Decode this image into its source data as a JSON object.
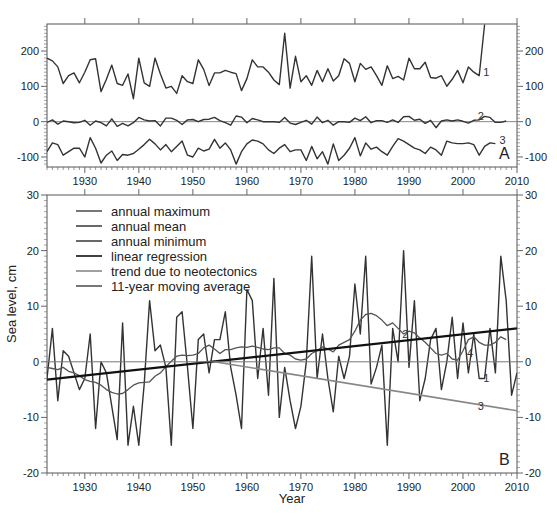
{
  "chart_data": [
    {
      "panel": "A",
      "type": "line",
      "title": "",
      "xlabel": "",
      "ylabel": "",
      "xlim": [
        1923,
        2010
      ],
      "ylim": [
        -120,
        275
      ],
      "x_ticks": [
        1930,
        1940,
        1950,
        1960,
        1970,
        1980,
        1990,
        2000,
        2010
      ],
      "y_ticks": [
        -100,
        0,
        100,
        200
      ],
      "panel_label": "A",
      "series": [
        {
          "name": "1",
          "label": "annual maximum",
          "start_year": 1923,
          "values": [
            180,
            172,
            155,
            108,
            130,
            138,
            110,
            140,
            175,
            178,
            85,
            120,
            160,
            108,
            103,
            135,
            65,
            180,
            110,
            100,
            180,
            135,
            95,
            100,
            80,
            130,
            113,
            108,
            175,
            148,
            102,
            138,
            138,
            145,
            140,
            136,
            88,
            122,
            175,
            155,
            155,
            140,
            118,
            105,
            250,
            95,
            185,
            113,
            130,
            103,
            145,
            113,
            150,
            115,
            130,
            178,
            165,
            113,
            165,
            148,
            155,
            130,
            103,
            158,
            122,
            128,
            118,
            180,
            150,
            150,
            168,
            125,
            123,
            130,
            100,
            120,
            145,
            110,
            155,
            140,
            130,
            275
          ],
          "color": "#333333"
        },
        {
          "name": "2",
          "label": "annual mean",
          "start_year": 1923,
          "values": [
            -2,
            5,
            -7,
            2,
            0,
            -3,
            -2,
            4,
            -10,
            2,
            -3,
            -12,
            8,
            -13,
            -5,
            -12,
            -3,
            12,
            5,
            2,
            3,
            -12,
            10,
            10,
            4,
            -8,
            5,
            6,
            0,
            6,
            7,
            12,
            3,
            -3,
            -10,
            16,
            13,
            -3,
            9,
            5,
            0,
            0,
            0,
            -2,
            12,
            -4,
            -8,
            -2,
            4,
            -7,
            13,
            -3,
            4,
            -10,
            0,
            0,
            -2,
            10,
            3,
            14,
            -3,
            3,
            3,
            -2,
            5,
            -2,
            14,
            15,
            4,
            7,
            -5,
            4,
            -17,
            2,
            5,
            2,
            5,
            1,
            -4,
            4,
            5,
            15,
            12,
            -2,
            -2,
            2
          ],
          "color": "#333333"
        },
        {
          "name": "3",
          "label": "annual minimum",
          "start_year": 1923,
          "values": [
            -85,
            -60,
            -65,
            -95,
            -85,
            -75,
            -75,
            -100,
            -45,
            -75,
            -117,
            -95,
            -83,
            -110,
            -93,
            -95,
            -90,
            -78,
            -65,
            -50,
            -63,
            -80,
            -65,
            -85,
            -70,
            -55,
            -95,
            -100,
            -75,
            -83,
            -78,
            -50,
            -75,
            -60,
            -80,
            -120,
            -85,
            -63,
            -52,
            -55,
            -63,
            -80,
            -90,
            -75,
            -65,
            -85,
            -80,
            -80,
            -110,
            -70,
            -105,
            -85,
            -120,
            -63,
            -110,
            -95,
            -75,
            -45,
            -97,
            -60,
            -78,
            -72,
            -85,
            -95,
            -70,
            -48,
            -55,
            -65,
            -75,
            -80,
            -90,
            -72,
            -80,
            -95,
            -55,
            -60,
            -62,
            -62,
            -60,
            -65,
            -95,
            -70,
            -60,
            -62
          ],
          "color": "#333333"
        }
      ],
      "annotations": [
        {
          "text": "1",
          "year": 2003
        },
        {
          "text": "2",
          "year": 2002
        },
        {
          "text": "3",
          "year": 2006
        }
      ]
    },
    {
      "panel": "B",
      "type": "line",
      "title": "",
      "xlabel": "Year",
      "ylabel": "Sea level, cm",
      "xlim": [
        1923,
        2010
      ],
      "ylim": [
        -20,
        30
      ],
      "x_ticks": [
        1930,
        1940,
        1950,
        1960,
        1970,
        1980,
        1990,
        2000,
        2010
      ],
      "y_ticks": [
        -20,
        -10,
        0,
        10,
        20,
        30
      ],
      "panel_label": "B",
      "legend": {
        "placement": "top-left",
        "entries": [
          {
            "label": "annual maximum",
            "color": "#555555"
          },
          {
            "label": "annual mean",
            "color": "#444444"
          },
          {
            "label": "annual minimum",
            "color": "#444444"
          },
          {
            "label": "linear regression",
            "color": "#111111"
          },
          {
            "label": "trend due to neotectonics",
            "color": "#888888"
          },
          {
            "label": "11-year moving average",
            "color": "#555555"
          }
        ]
      },
      "series": [
        {
          "name": "1",
          "label": "annual mean",
          "start_year": 1923,
          "values": [
            -3,
            6,
            -7,
            2,
            1,
            -2,
            -5,
            -3,
            5,
            -12,
            0,
            -2,
            -8,
            -14,
            7,
            -15,
            -8,
            -15,
            -4,
            11,
            2,
            3,
            -1,
            -15,
            8,
            9,
            -1,
            -12,
            4,
            5,
            -2,
            4,
            4,
            9,
            -1,
            -6,
            -12,
            13,
            11,
            -3,
            6,
            -6,
            15,
            -10,
            -1,
            -7,
            -12,
            -8,
            0,
            19,
            -3,
            5,
            -3,
            -9,
            1,
            -3,
            1,
            14,
            5,
            19,
            -4,
            -1,
            3,
            -15,
            6,
            0,
            20,
            -1,
            11,
            -7,
            -3,
            4,
            6,
            -5,
            0,
            8,
            -3,
            7,
            -2,
            5,
            -3,
            -3,
            6,
            -2,
            19,
            11,
            -6,
            -2
          ],
          "color": "#333333"
        },
        {
          "name": "4",
          "label": "11-year moving average",
          "start_year": 1923,
          "values": [
            -1,
            -1.2,
            -1.4,
            -1,
            -1.7,
            -2,
            -2.5,
            -3.2,
            -3.5,
            -3.7,
            -4.2,
            -5,
            -5.5,
            -5.8,
            -5.7,
            -5,
            -4.2,
            -3.8,
            -3.7,
            -3.6,
            -2.6,
            -2,
            -0.9,
            0.1,
            1,
            1.2,
            1.1,
            1.2,
            1.5,
            2.5,
            3,
            2.3,
            1.5,
            2.2,
            2.2,
            2.5,
            2.7,
            2.6,
            2.8,
            2.6,
            2.3,
            2.2,
            2.5,
            2.5,
            1.5,
            1.2,
            0.5,
            0.3,
            0.5,
            1.5,
            2,
            2.7,
            2.3,
            1.8,
            3,
            3.5,
            4,
            5.5,
            7.5,
            8.5,
            8.7,
            8.3,
            7.5,
            6.5,
            7,
            6,
            5,
            5.5,
            5.2,
            4.3,
            3.5,
            2.5,
            1.5,
            1.2,
            1.5,
            0.5,
            0.3,
            2,
            4,
            4.5,
            3.5,
            3,
            3,
            3.5,
            4.5,
            4
          ],
          "color": "#555555"
        },
        {
          "name": "2",
          "label": "linear regression",
          "x": [
            1923,
            2010
          ],
          "values": [
            -3.2,
            6.0
          ],
          "color": "#111111"
        },
        {
          "name": "3",
          "label": "trend due to neotectonics",
          "x": [
            1954,
            2010
          ],
          "values": [
            0,
            -8.8
          ],
          "color": "#888888"
        },
        {
          "name": "zero",
          "label": "zero line",
          "x": [
            1923,
            2010
          ],
          "values": [
            0,
            0
          ],
          "color": "#777777"
        }
      ],
      "annotations": [
        {
          "text": "1",
          "year": 2003,
          "value": -3
        },
        {
          "text": "2",
          "year": 1988,
          "value": 5
        },
        {
          "text": "3",
          "year": 2002,
          "value": -8
        },
        {
          "text": "4",
          "year": 2000,
          "value": 1.5
        }
      ]
    }
  ]
}
